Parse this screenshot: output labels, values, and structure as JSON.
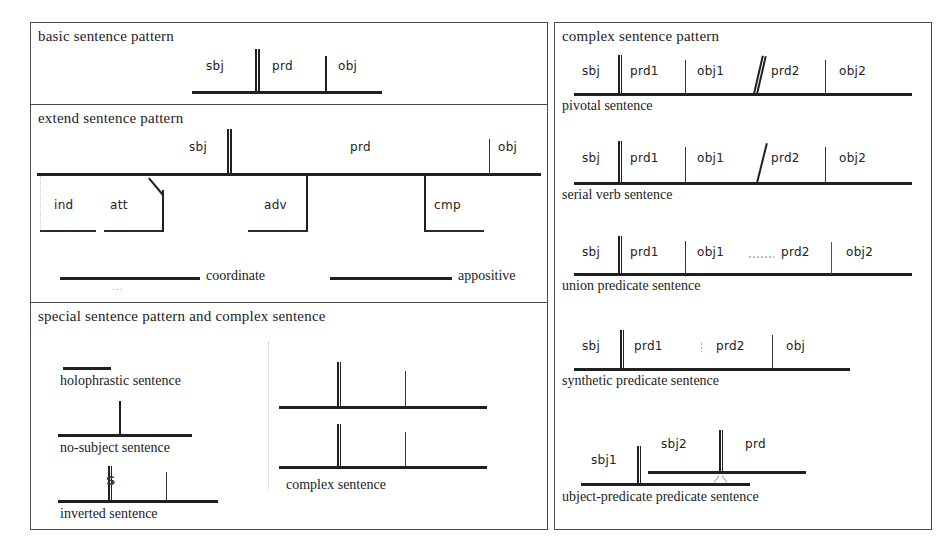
{
  "panels": {
    "basic": {
      "title": "basic sentence pattern",
      "roles": [
        "sbj",
        "prd",
        "obj"
      ]
    },
    "extend": {
      "title": "extend sentence pattern",
      "top_roles": [
        "sbj",
        "prd",
        "obj"
      ],
      "sub_roles": [
        "ind",
        "att",
        "adv",
        "cmp"
      ],
      "relations": [
        "coordinate",
        "appositive"
      ],
      "ellipsis": "..."
    },
    "special": {
      "title": "special sentence pattern  and complex sentence",
      "items": [
        {
          "caption": "holophrastic sentence"
        },
        {
          "caption": "no-subject sentence"
        },
        {
          "caption": "inverted sentence",
          "marker": "S"
        },
        {
          "caption": "complex sentence"
        }
      ]
    },
    "complex": {
      "title": "complex sentence pattern",
      "items": [
        {
          "caption": "pivotal sentence",
          "roles": [
            "sbj",
            "prd1",
            "obj1",
            "prd2",
            "obj2"
          ],
          "separator": "double-slash"
        },
        {
          "caption": "serial verb sentence",
          "roles": [
            "sbj",
            "prd1",
            "obj1",
            "prd2",
            "obj2"
          ],
          "separator": "single-slash"
        },
        {
          "caption": "union predicate sentence",
          "roles": [
            "sbj",
            "prd1",
            "obj1",
            "prd2",
            "obj2"
          ],
          "separator": "dotted"
        },
        {
          "caption": "synthetic predicate sentence",
          "roles": [
            "sbj",
            "prd1",
            "prd2",
            "obj"
          ],
          "separator": "dotted-tick"
        },
        {
          "caption": "ubject-predicate predicate sentence",
          "roles": [
            "sbj1",
            "sbj2",
            "prd"
          ],
          "separator": "nested-baseline"
        }
      ]
    }
  },
  "colors": {
    "line": "#202020",
    "border": "#4a4a4a",
    "faint": "#b9b9b9",
    "background": "#ffffff"
  }
}
